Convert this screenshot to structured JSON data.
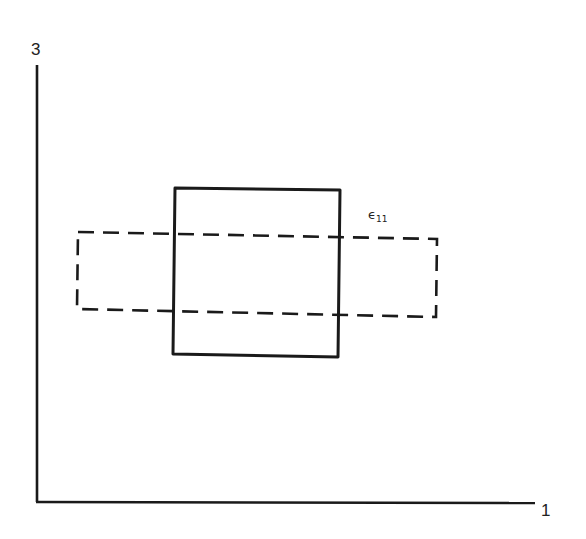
{
  "diagram": {
    "axes": {
      "vertical": {
        "label": "3",
        "x": 37,
        "y_top": 65,
        "y_bottom": 502
      },
      "horizontal": {
        "label": "1",
        "y": 502,
        "x_left": 37,
        "x_right": 535
      }
    },
    "original_shape": {
      "style": "solid",
      "points": "175,188 340,190 338,357 173,354"
    },
    "deformed_shape": {
      "style": "dashed",
      "points": "78,232 437,239 436,317 77,309"
    },
    "strain_label": {
      "symbol": "ϵ",
      "subscript": "11"
    },
    "colors": {
      "line": "#1a1a1a",
      "background": "#ffffff"
    }
  }
}
